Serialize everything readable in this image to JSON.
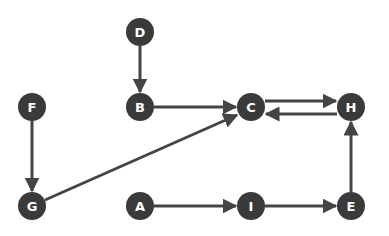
{
  "diagram": {
    "type": "directed-graph",
    "colors": {
      "node_fill": "#3a3a3a",
      "edge": "#444444",
      "label": "#ffffff",
      "background": "#ffffff"
    },
    "node_radius": 14,
    "nodes": [
      {
        "id": "D",
        "label": "D",
        "x": 140,
        "y": 32
      },
      {
        "id": "F",
        "label": "F",
        "x": 32,
        "y": 107
      },
      {
        "id": "B",
        "label": "B",
        "x": 140,
        "y": 107
      },
      {
        "id": "C",
        "label": "C",
        "x": 251,
        "y": 107
      },
      {
        "id": "H",
        "label": "H",
        "x": 351,
        "y": 107
      },
      {
        "id": "G",
        "label": "G",
        "x": 32,
        "y": 206
      },
      {
        "id": "A",
        "label": "A",
        "x": 140,
        "y": 206
      },
      {
        "id": "I",
        "label": "I",
        "x": 251,
        "y": 206
      },
      {
        "id": "E",
        "label": "E",
        "x": 351,
        "y": 206
      }
    ],
    "edges": [
      {
        "from": "D",
        "to": "B",
        "x1": 140,
        "y1": 46,
        "x2": 140,
        "y2": 92
      },
      {
        "from": "B",
        "to": "C",
        "x1": 154,
        "y1": 107,
        "x2": 236,
        "y2": 107
      },
      {
        "from": "C",
        "to": "H",
        "x1": 265,
        "y1": 101,
        "x2": 336,
        "y2": 101
      },
      {
        "from": "H",
        "to": "C",
        "x1": 337,
        "y1": 114,
        "x2": 266,
        "y2": 114
      },
      {
        "from": "F",
        "to": "G",
        "x1": 32,
        "y1": 121,
        "x2": 32,
        "y2": 191
      },
      {
        "from": "G",
        "to": "C",
        "x1": 45,
        "y1": 200,
        "x2": 237,
        "y2": 115
      },
      {
        "from": "A",
        "to": "I",
        "x1": 154,
        "y1": 206,
        "x2": 236,
        "y2": 206
      },
      {
        "from": "I",
        "to": "E",
        "x1": 265,
        "y1": 206,
        "x2": 336,
        "y2": 206
      },
      {
        "from": "E",
        "to": "H",
        "x1": 351,
        "y1": 192,
        "x2": 351,
        "y2": 122
      }
    ]
  }
}
